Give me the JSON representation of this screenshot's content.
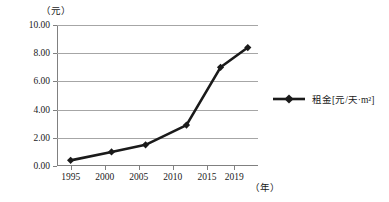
{
  "chart_data": {
    "type": "line",
    "title": "",
    "xlabel": "（年）",
    "ylabel": "（元）",
    "ylim": [
      0,
      10
    ],
    "xlim": [
      1993,
      2022.5
    ],
    "grid": true,
    "legend_position": "right",
    "y_ticks": [
      "0.00",
      "2.00",
      "4.00",
      "6.00",
      "8.00",
      "10.00"
    ],
    "y_tick_values": [
      0,
      2,
      4,
      6,
      8,
      10
    ],
    "x_ticks": [
      "1995",
      "2000",
      "2005",
      "2010",
      "2015",
      "2019"
    ],
    "x_tick_values": [
      1995,
      2000,
      2005,
      2010,
      2015,
      2019
    ],
    "series": [
      {
        "name": "租金[元/天·m²]",
        "color": "#1a1a1a",
        "marker": "diamond",
        "x": [
          1995,
          2001,
          2006,
          2012,
          2017,
          2021
        ],
        "values": [
          0.4,
          1.0,
          1.5,
          2.9,
          7.0,
          8.4
        ]
      }
    ]
  },
  "legend": {
    "entries": [
      {
        "label": "租金[元/天·m²]",
        "color": "#1a1a1a"
      }
    ]
  },
  "axes": {
    "y_unit_caption": "（元）",
    "x_unit_caption": "（年）"
  }
}
